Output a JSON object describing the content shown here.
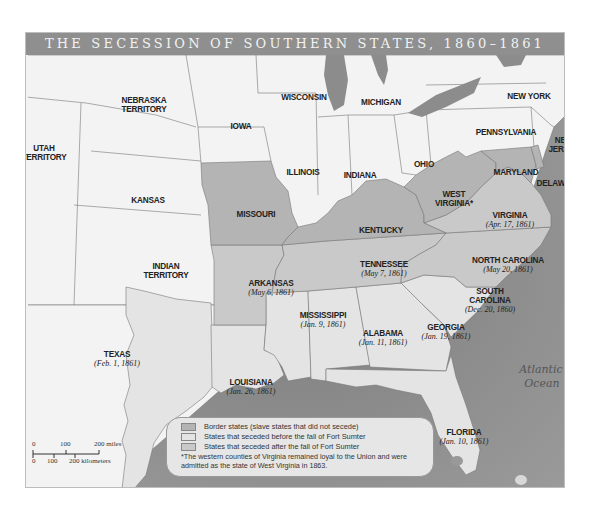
{
  "title": "THE SECESSION OF SOUTHERN STATES, 1860–1861",
  "colors": {
    "frame_bg": "#e9e9e9",
    "title_bar": "#8f8f8f",
    "union": "#f3f3f3",
    "border_state": "#b4b4b4",
    "seceded_before": "#e4e4e4",
    "seceded_after": "#c9c9c9",
    "ocean": "#8a8a8a",
    "lake": "#8c8c8c"
  },
  "states": [
    {
      "name": "NEBRASKA",
      "name2": "TERRITORY",
      "date": "",
      "category": "union",
      "x": 118,
      "y": 48
    },
    {
      "name": "IOWA",
      "name2": "",
      "date": "",
      "category": "union",
      "x": 215,
      "y": 74
    },
    {
      "name": "WISCONSIN",
      "name2": "",
      "date": "",
      "category": "union",
      "x": 278,
      "y": 45
    },
    {
      "name": "MICHIGAN",
      "name2": "",
      "date": "",
      "category": "union",
      "x": 355,
      "y": 50
    },
    {
      "name": "NEW YORK",
      "name2": "",
      "date": "",
      "category": "union",
      "x": 503,
      "y": 44
    },
    {
      "name": "PENNSYLVANIA",
      "name2": "",
      "date": "",
      "category": "union",
      "x": 480,
      "y": 80
    },
    {
      "name": "NEW",
      "name2": "JERSEY",
      "date": "",
      "category": "union",
      "x": 538,
      "y": 88
    },
    {
      "name": "UTAH",
      "name2": "TERRITORY",
      "date": "",
      "category": "union",
      "x": 18,
      "y": 96
    },
    {
      "name": "ILLINOIS",
      "name2": "",
      "date": "",
      "category": "union",
      "x": 277,
      "y": 120
    },
    {
      "name": "INDIANA",
      "name2": "",
      "date": "",
      "category": "union",
      "x": 334,
      "y": 123
    },
    {
      "name": "OHIO",
      "name2": "",
      "date": "",
      "category": "union",
      "x": 398,
      "y": 112
    },
    {
      "name": "KANSAS",
      "name2": "",
      "date": "",
      "category": "union",
      "x": 122,
      "y": 148
    },
    {
      "name": "MARYLAND",
      "name2": "",
      "date": "",
      "category": "border",
      "x": 490,
      "y": 120
    },
    {
      "name": "DELAWARE",
      "name2": "",
      "date": "",
      "category": "border",
      "x": 533,
      "y": 131
    },
    {
      "name": "MISSOURI",
      "name2": "",
      "date": "",
      "category": "border",
      "x": 230,
      "y": 162
    },
    {
      "name": "WEST",
      "name2": "VIRGINIA*",
      "date": "",
      "category": "border",
      "x": 428,
      "y": 142
    },
    {
      "name": "KENTUCKY",
      "name2": "",
      "date": "",
      "category": "border",
      "x": 355,
      "y": 178
    },
    {
      "name": "VIRGINIA",
      "name2": "",
      "date": "(Apr. 17, 1861)",
      "category": "after",
      "x": 484,
      "y": 163
    },
    {
      "name": "INDIAN",
      "name2": "TERRITORY",
      "date": "",
      "category": "union",
      "x": 140,
      "y": 214
    },
    {
      "name": "TENNESSEE",
      "name2": "",
      "date": "(May 7, 1861)",
      "category": "after",
      "x": 358,
      "y": 212
    },
    {
      "name": "NORTH CAROLINA",
      "name2": "",
      "date": "(May 20, 1861)",
      "category": "after",
      "x": 482,
      "y": 208
    },
    {
      "name": "ARKANSAS",
      "name2": "",
      "date": "(May 6, 1861)",
      "category": "after",
      "x": 245,
      "y": 231
    },
    {
      "name": "SOUTH",
      "name2": "CAROLINA",
      "date": "(Dec. 20, 1860)",
      "category": "before",
      "x": 464,
      "y": 239
    },
    {
      "name": "MISSISSIPPI",
      "name2": "",
      "date": "(Jan. 9, 1861)",
      "category": "before",
      "x": 297,
      "y": 263
    },
    {
      "name": "ALABAMA",
      "name2": "",
      "date": "(Jan. 11, 1861)",
      "category": "before",
      "x": 357,
      "y": 281
    },
    {
      "name": "GEORGIA",
      "name2": "",
      "date": "(Jan. 19, 1861)",
      "category": "before",
      "x": 420,
      "y": 275
    },
    {
      "name": "TEXAS",
      "name2": "",
      "date": "(Feb. 1, 1861)",
      "category": "before",
      "x": 91,
      "y": 302
    },
    {
      "name": "LOUISIANA",
      "name2": "",
      "date": "(Jan. 26, 1861)",
      "category": "before",
      "x": 225,
      "y": 330
    },
    {
      "name": "FLORIDA",
      "name2": "",
      "date": "(Jan. 10, 1861)",
      "category": "before",
      "x": 438,
      "y": 380
    }
  ],
  "water_labels": [
    {
      "text": "Gulf of Mexico",
      "x": 314,
      "y": 374,
      "size": 10
    },
    {
      "text": "Atlantic",
      "x": 515,
      "y": 318,
      "size": 11
    },
    {
      "text": "Ocean",
      "x": 516,
      "y": 332,
      "size": 11
    }
  ],
  "legend": {
    "items": [
      {
        "label": "Border states (slave states that did not secede)",
        "swatch": "#b4b4b4"
      },
      {
        "label": "States that seceded before the fall of Fort Sumter",
        "swatch": "#e4e4e4"
      },
      {
        "label": "States that seceded after the fall of Fort Sumter",
        "swatch": "#c9c9c9"
      }
    ],
    "note": "*The western counties of Virginia remained loyal to the Union and were admitted as the state of West Virginia in 1863."
  },
  "scale_bar": {
    "miles_ticks": [
      "0",
      "100",
      "200 miles"
    ],
    "km_ticks": [
      "0",
      "100",
      "200 kilometers"
    ]
  }
}
